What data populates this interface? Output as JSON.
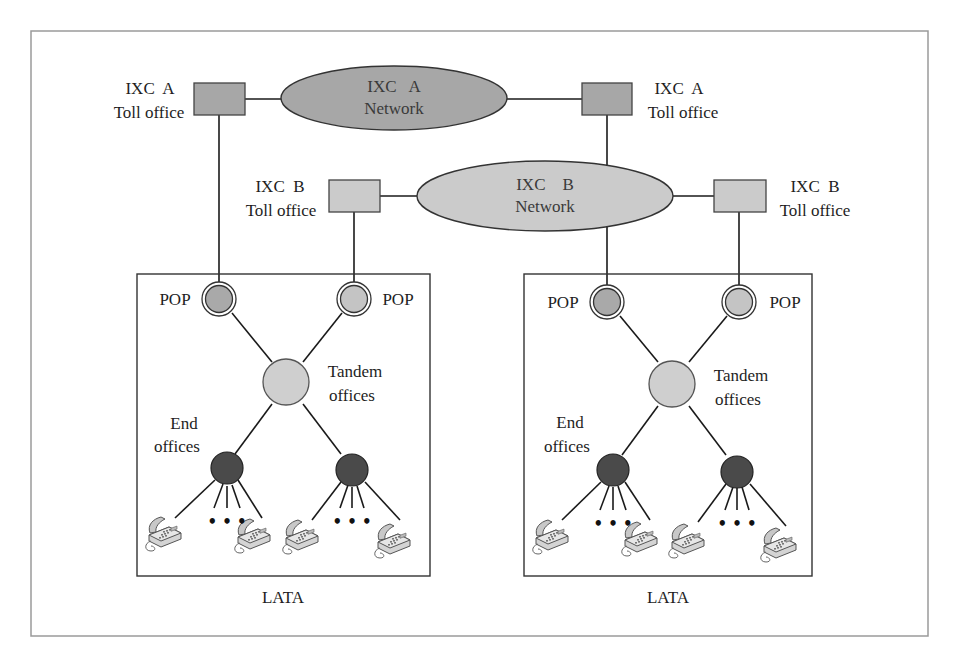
{
  "figure": {
    "frame": {
      "x": 31,
      "y": 31,
      "w": 897,
      "h": 605,
      "stroke": "#9a9a9a"
    },
    "colors": {
      "ixc_a_fill": "#a7a7a7",
      "ixc_b_fill": "#cbcbcb",
      "pop_fill": "#a9a9a9",
      "tandem_fill": "#cfcfcf",
      "end_office_fill": "#4a4a4a",
      "line": "#1a1a1a",
      "lata_border": "#333333"
    },
    "networks": [
      {
        "id": "ixc-a",
        "line1": "IXC   A",
        "line2": "Network",
        "cx": 394,
        "cy": 98,
        "rx": 113,
        "ry": 32
      },
      {
        "id": "ixc-b",
        "line1": "IXC    B",
        "line2": "Network",
        "cx": 545,
        "cy": 196,
        "rx": 128,
        "ry": 35
      }
    ],
    "toll_offices": [
      {
        "id": "ixc-a-left",
        "carrier": "IXC  A",
        "label": "Toll office",
        "x": 194,
        "y": 83,
        "w": 51,
        "h": 32,
        "label_side": "left"
      },
      {
        "id": "ixc-a-right",
        "carrier": "IXC  A",
        "label": "Toll office",
        "x": 582,
        "y": 83,
        "w": 50,
        "h": 32,
        "label_side": "right"
      },
      {
        "id": "ixc-b-left",
        "carrier": "IXC  B",
        "label": "Toll office",
        "x": 329,
        "y": 180,
        "w": 51,
        "h": 32,
        "label_side": "left"
      },
      {
        "id": "ixc-b-right",
        "carrier": "IXC  B",
        "label": "Toll office",
        "x": 714,
        "y": 180,
        "w": 52,
        "h": 32,
        "label_side": "right"
      }
    ],
    "latas": [
      {
        "id": "lata-left",
        "label": "LATA",
        "box": {
          "x": 137,
          "y": 274,
          "w": 293,
          "h": 302
        },
        "pop_label": "POP",
        "tandem_label_1": "Tandem",
        "tandem_label_2": "offices",
        "end_label_1": "End",
        "end_label_2": "offices",
        "ellipsis": "• • •"
      },
      {
        "id": "lata-right",
        "label": "LATA",
        "box": {
          "x": 524,
          "y": 274,
          "w": 288,
          "h": 302
        },
        "pop_label": "POP",
        "tandem_label_1": "Tandem",
        "tandem_label_2": "offices",
        "end_label_1": "End",
        "end_label_2": "offices",
        "ellipsis": "• • •"
      }
    ]
  }
}
